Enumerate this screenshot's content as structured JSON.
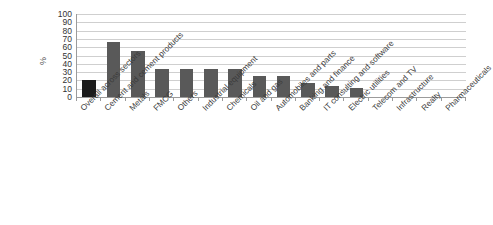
{
  "chart_data": {
    "type": "bar",
    "title": "",
    "subtitle": "",
    "xlabel": "",
    "ylabel": "%",
    "ylim": [
      0,
      100
    ],
    "ytick_step": 10,
    "yticks": [
      0,
      10,
      20,
      30,
      40,
      50,
      60,
      70,
      80,
      90,
      100
    ],
    "grid": true,
    "legend": "none",
    "categories": [
      "Overall across sectors",
      "Cement and cement products",
      "Metals",
      "FMCG",
      "Others",
      "Industrial equipment",
      "Chemicals",
      "Oil and gas",
      "Automobiles and parts",
      "Banking and finance",
      "IT consulting and software",
      "Electric utilities",
      "Telecom and TV",
      "Infrastructure",
      "Realty",
      "Pharmaceuticals"
    ],
    "values": [
      20,
      66,
      56,
      34,
      34,
      34,
      34,
      25,
      25,
      17,
      13,
      11,
      0,
      0,
      0,
      0
    ],
    "bar_colors": [
      "#1c1c1c",
      "#595959",
      "#595959",
      "#595959",
      "#595959",
      "#595959",
      "#595959",
      "#595959",
      "#595959",
      "#595959",
      "#595959",
      "#595959",
      "#595959",
      "#595959",
      "#595959",
      "#595959"
    ],
    "highlight_index": 0,
    "axis_color": "#9b9b9b",
    "gridline_color": "#cfcfcf",
    "background": "#ffffff"
  }
}
